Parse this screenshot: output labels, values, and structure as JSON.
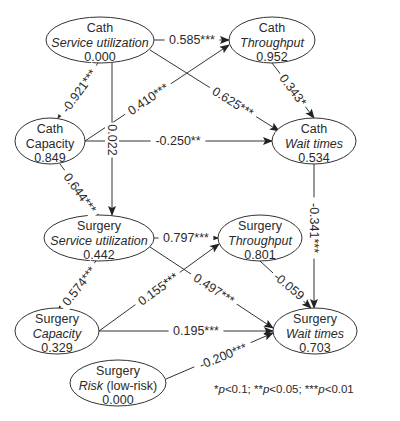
{
  "diagram": {
    "type": "path-model",
    "nodes": [
      {
        "id": "cath_util",
        "group": "Cath",
        "name": "Service utilization",
        "name_italic": true,
        "suffix": "",
        "value": "0.000",
        "cx": 100,
        "cy": 40,
        "rx": 54,
        "ry": 23
      },
      {
        "id": "cath_thru",
        "group": "Cath",
        "name": "Throughput",
        "name_italic": true,
        "suffix": "",
        "value": "0.952",
        "cx": 272,
        "cy": 40,
        "rx": 43,
        "ry": 23
      },
      {
        "id": "cath_cap",
        "group": "Cath",
        "name": "Capacity",
        "name_italic": false,
        "suffix": "",
        "value": "0.849",
        "cx": 50,
        "cy": 141,
        "rx": 35,
        "ry": 23
      },
      {
        "id": "cath_wait",
        "group": "Cath",
        "name": "Wait times",
        "name_italic": true,
        "suffix": "",
        "value": "0.534",
        "cx": 314,
        "cy": 141,
        "rx": 42,
        "ry": 23
      },
      {
        "id": "surg_util",
        "group": "Surgery",
        "name": "Service utilization",
        "name_italic": true,
        "suffix": "",
        "value": "0.442",
        "cx": 99,
        "cy": 238,
        "rx": 55,
        "ry": 23
      },
      {
        "id": "surg_thru",
        "group": "Surgery",
        "name": "Throughput",
        "name_italic": true,
        "suffix": "",
        "value": "0.801",
        "cx": 260,
        "cy": 238,
        "rx": 42,
        "ry": 23
      },
      {
        "id": "surg_cap",
        "group": "Surgery",
        "name": "Capacity",
        "name_italic": true,
        "suffix": "",
        "value": "0.329",
        "cx": 57,
        "cy": 331,
        "rx": 42,
        "ry": 23
      },
      {
        "id": "surg_risk",
        "group": "Surgery",
        "name": "Risk",
        "name_italic": true,
        "suffix": " (low-risk)",
        "value": "0.000",
        "cx": 118,
        "cy": 383,
        "rx": 48,
        "ry": 23
      },
      {
        "id": "surg_wait",
        "group": "Surgery",
        "name": "Wait times",
        "name_italic": true,
        "suffix": "",
        "value": "0.703",
        "cx": 315,
        "cy": 331,
        "rx": 42,
        "ry": 23
      }
    ],
    "edges": [
      {
        "from": "cath_util",
        "to": "cath_thru",
        "label": "0.585***",
        "points": [
          [
            154,
            40
          ],
          [
            229,
            40
          ]
        ],
        "lx": 192,
        "ly": 40,
        "angle": 0
      },
      {
        "from": "cath_util",
        "to": "cath_wait",
        "label": "0.625***",
        "points": [
          [
            150,
            50
          ],
          [
            279,
            131
          ]
        ],
        "lx": 233,
        "ly": 102,
        "angle": 32
      },
      {
        "from": "cath_util",
        "to": "cath_cap",
        "label": "-0.921***",
        "points": [
          [
            98,
            63
          ],
          [
            58,
            118
          ]
        ],
        "lx": 79,
        "ly": 91,
        "angle": -54
      },
      {
        "from": "cath_util",
        "to": "surg_util",
        "label": "0.022",
        "points": [
          [
            112,
            63
          ],
          [
            112,
            215
          ]
        ],
        "lx": 112,
        "ly": 140,
        "angle": 90
      },
      {
        "from": "cath_cap",
        "to": "cath_thru",
        "label": "0.410***",
        "points": [
          [
            85,
            141
          ],
          [
            229,
            45
          ]
        ],
        "lx": 148,
        "ly": 99,
        "angle": -34
      },
      {
        "from": "cath_cap",
        "to": "cath_wait",
        "label": "-0.250**",
        "points": [
          [
            85,
            141
          ],
          [
            272,
            141
          ]
        ],
        "lx": 178,
        "ly": 141,
        "angle": 0
      },
      {
        "from": "cath_cap",
        "to": "surg_util",
        "label": "0.644***",
        "points": [
          [
            60,
            164
          ],
          [
            98,
            215
          ]
        ],
        "lx": 80,
        "ly": 193,
        "angle": 54
      },
      {
        "from": "cath_thru",
        "to": "cath_wait",
        "label": "0.343*",
        "points": [
          [
            272,
            63
          ],
          [
            314,
            118
          ]
        ],
        "lx": 293,
        "ly": 90,
        "angle": 53
      },
      {
        "from": "cath_wait",
        "to": "surg_wait",
        "label": "-0.341***",
        "points": [
          [
            314,
            164
          ],
          [
            314,
            308
          ]
        ],
        "lx": 314,
        "ly": 228,
        "angle": 90
      },
      {
        "from": "surg_util",
        "to": "surg_thru",
        "label": "0.797***",
        "points": [
          [
            154,
            238
          ],
          [
            218,
            238
          ]
        ],
        "lx": 186,
        "ly": 238,
        "angle": 0
      },
      {
        "from": "surg_util",
        "to": "surg_wait",
        "label": "0.497***",
        "points": [
          [
            150,
            247
          ],
          [
            273,
            328
          ]
        ],
        "lx": 214,
        "ly": 289,
        "angle": 33
      },
      {
        "from": "surg_util",
        "to": "surg_cap",
        "label": "0.574***",
        "points": [
          [
            96,
            261
          ],
          [
            59,
            308
          ]
        ],
        "lx": 79,
        "ly": 286,
        "angle": -52
      },
      {
        "from": "surg_cap",
        "to": "surg_thru",
        "label": "0.155***",
        "points": [
          [
            99,
            331
          ],
          [
            219,
            244
          ]
        ],
        "lx": 158,
        "ly": 289,
        "angle": -36
      },
      {
        "from": "surg_cap",
        "to": "surg_wait",
        "label": "0.195***",
        "points": [
          [
            99,
            331
          ],
          [
            273,
            331
          ]
        ],
        "lx": 196,
        "ly": 331,
        "angle": 0
      },
      {
        "from": "surg_thru",
        "to": "surg_wait",
        "label": "-0.059",
        "points": [
          [
            260,
            261
          ],
          [
            311,
            308
          ]
        ],
        "lx": 289,
        "ly": 286,
        "angle": 40
      },
      {
        "from": "surg_risk",
        "to": "surg_wait",
        "label": "-0.200***",
        "points": [
          [
            166,
            379
          ],
          [
            273,
            333
          ]
        ],
        "lx": 223,
        "ly": 356,
        "angle": -22
      }
    ],
    "footnote": {
      "parts": [
        {
          "text": "*",
          "italic": false
        },
        {
          "text": "p",
          "italic": true
        },
        {
          "text": "<0.1; **",
          "italic": false
        },
        {
          "text": "p",
          "italic": true
        },
        {
          "text": "<0.05; ***",
          "italic": false
        },
        {
          "text": "p",
          "italic": true
        },
        {
          "text": "<0.01",
          "italic": false
        }
      ],
      "x": 214,
      "y": 393
    },
    "colors": {
      "stroke": "#333333",
      "text": "#2a2a2a",
      "background": "#ffffff"
    }
  }
}
